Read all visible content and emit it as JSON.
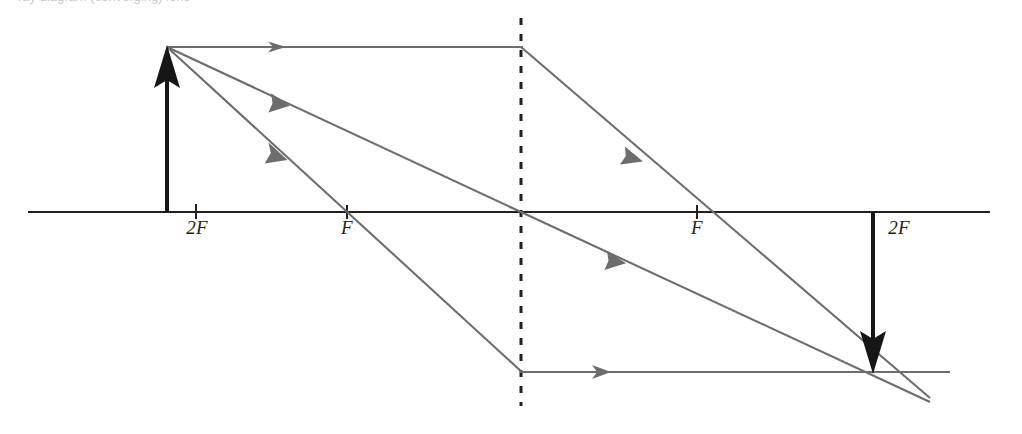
{
  "figure": {
    "cropped_caption_fragment": "ray diagram (converging) lens",
    "colors": {
      "axis": "#231f20",
      "object_arrow": "#161616",
      "image_arrow": "#161616",
      "ray": "#6d6d6d",
      "lens_dashed": "#231f20",
      "label_text": "#231f20"
    },
    "canvas": {
      "width": 1022,
      "height": 434
    }
  },
  "labels": [
    {
      "name": "label-object-2F",
      "text": "2F",
      "x": 197,
      "y": 227
    },
    {
      "name": "label-object-F",
      "text": "F",
      "x": 347,
      "y": 227
    },
    {
      "name": "label-image-F",
      "text": "F",
      "x": 697,
      "y": 227
    },
    {
      "name": "label-image-2F",
      "text": "2F",
      "x": 899,
      "y": 227
    }
  ],
  "geometry": {
    "principal_axis": {
      "x1": 28,
      "y1": 212,
      "x2": 990,
      "y2": 212
    },
    "lens": {
      "x": 521,
      "y_top": 18,
      "y_bottom": 406,
      "style": "dashed"
    },
    "object": {
      "name": "object-arrow",
      "base_x": 167,
      "base_y": 212,
      "tip_x": 167,
      "tip_y": 47,
      "direction": "up",
      "height_px": 165
    },
    "image": {
      "name": "image-arrow",
      "base_x": 873,
      "base_y": 212,
      "tip_x": 873,
      "tip_y": 372,
      "direction": "down",
      "height_px": 160
    },
    "focal_ticks": [
      {
        "x": 196,
        "label": "2F"
      },
      {
        "x": 347,
        "label": "F"
      },
      {
        "x": 697,
        "label": "F"
      },
      {
        "x": 873,
        "label": "2F"
      }
    ],
    "rays": [
      {
        "name": "ray-parallel",
        "description": "Parallel to axis from object tip, refracts through far focal point F",
        "incident": {
          "x1": 167,
          "y1": 47,
          "x2": 521,
          "y2": 47
        },
        "refracted": {
          "x1": 521,
          "y1": 47,
          "x2": 930,
          "y2": 398
        },
        "arrowheads": [
          {
            "x": 282,
            "y": 47,
            "angle": 0
          },
          {
            "x": 638,
            "y": 147,
            "angle": 40.6
          }
        ]
      },
      {
        "name": "ray-center",
        "description": "Through optical centre of lens, undeviated",
        "incident": {
          "x1": 167,
          "y1": 47,
          "x2": 521,
          "y2": 212
        },
        "refracted": {
          "x1": 521,
          "y1": 212,
          "x2": 930,
          "y2": 402
        },
        "arrowheads": [
          {
            "x": 283,
            "y": 101,
            "angle": 25
          },
          {
            "x": 620,
            "y": 258,
            "angle": 25
          }
        ]
      },
      {
        "name": "ray-focal",
        "description": "Through near focal point F, refracts parallel to axis",
        "incident": {
          "x1": 167,
          "y1": 47,
          "x2": 521,
          "y2": 372
        },
        "refracted": {
          "x1": 521,
          "y1": 372,
          "x2": 950,
          "y2": 372
        },
        "arrowheads": [
          {
            "x": 281,
            "y": 152,
            "angle": 42.5
          },
          {
            "x": 608,
            "y": 372,
            "angle": 0
          }
        ]
      }
    ],
    "convergence_point": {
      "x": 873,
      "y": 372
    }
  }
}
